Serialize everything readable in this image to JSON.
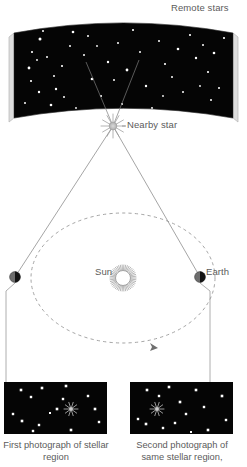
{
  "figure": {
    "topic": "stellar-parallax",
    "background_color": "#ffffff",
    "ink_color": "#5b5b5b",
    "sky_color": "#050505",
    "star_color": "#ffffff",
    "slab_edge_color": "#d8d8d8"
  },
  "labels": {
    "remote_stars": "Remote stars",
    "nearby_star": "Nearby star",
    "sun": "Sun",
    "earth": "Earth"
  },
  "captions": {
    "first_photo": "First photograph of stellar region",
    "second_photo": "Second photograph of same stellar region,"
  },
  "icons": {
    "nearby_star": "starburst-icon",
    "sun": "sun-rays-icon",
    "earth_left": "earth-half-lit-icon",
    "earth_right": "earth-half-lit-icon",
    "orbit_direction": "arrowhead-icon",
    "photo_star_left": "starburst-icon",
    "photo_star_right": "starburst-icon"
  },
  "sky_panel": {
    "left": 14,
    "top": 20,
    "right": 233,
    "bottom": 118,
    "curve_sag": 13,
    "stars": [
      {
        "x": 40,
        "y": 39,
        "r": 1.5
      },
      {
        "x": 32,
        "y": 52,
        "r": 1.1
      },
      {
        "x": 43,
        "y": 31,
        "r": 1.0
      },
      {
        "x": 29,
        "y": 68,
        "r": 1.4
      },
      {
        "x": 31,
        "y": 81,
        "r": 1.1
      },
      {
        "x": 39,
        "y": 92,
        "r": 1.2
      },
      {
        "x": 25,
        "y": 103,
        "r": 1.0
      },
      {
        "x": 51,
        "y": 105,
        "r": 1.3
      },
      {
        "x": 54,
        "y": 76,
        "r": 1.0
      },
      {
        "x": 62,
        "y": 66,
        "r": 1.1
      },
      {
        "x": 47,
        "y": 57,
        "r": 1.0
      },
      {
        "x": 37,
        "y": 60,
        "r": 0.9
      },
      {
        "x": 56,
        "y": 89,
        "r": 1.2
      },
      {
        "x": 70,
        "y": 46,
        "r": 1.0
      },
      {
        "x": 73,
        "y": 32,
        "r": 1.3
      },
      {
        "x": 84,
        "y": 55,
        "r": 1.0
      },
      {
        "x": 92,
        "y": 79,
        "r": 1.3
      },
      {
        "x": 88,
        "y": 36,
        "r": 1.0
      },
      {
        "x": 101,
        "y": 96,
        "r": 1.1
      },
      {
        "x": 108,
        "y": 62,
        "r": 1.2
      },
      {
        "x": 118,
        "y": 43,
        "r": 1.0
      },
      {
        "x": 114,
        "y": 80,
        "r": 1.0
      },
      {
        "x": 127,
        "y": 70,
        "r": 1.4
      },
      {
        "x": 133,
        "y": 30,
        "r": 1.1
      },
      {
        "x": 140,
        "y": 52,
        "r": 1.0
      },
      {
        "x": 146,
        "y": 86,
        "r": 1.2
      },
      {
        "x": 152,
        "y": 108,
        "r": 1.0
      },
      {
        "x": 159,
        "y": 41,
        "r": 1.0
      },
      {
        "x": 165,
        "y": 64,
        "r": 1.1
      },
      {
        "x": 172,
        "y": 77,
        "r": 1.0
      },
      {
        "x": 178,
        "y": 49,
        "r": 1.3
      },
      {
        "x": 183,
        "y": 92,
        "r": 1.0
      },
      {
        "x": 190,
        "y": 35,
        "r": 1.1
      },
      {
        "x": 196,
        "y": 58,
        "r": 1.2
      },
      {
        "x": 203,
        "y": 45,
        "r": 1.0
      },
      {
        "x": 208,
        "y": 72,
        "r": 1.1
      },
      {
        "x": 214,
        "y": 53,
        "r": 1.3
      },
      {
        "x": 219,
        "y": 88,
        "r": 1.0
      },
      {
        "x": 224,
        "y": 38,
        "r": 1.1
      },
      {
        "x": 211,
        "y": 100,
        "r": 1.0
      },
      {
        "x": 200,
        "y": 86,
        "r": 0.9
      },
      {
        "x": 163,
        "y": 96,
        "r": 0.9
      },
      {
        "x": 97,
        "y": 46,
        "r": 0.9
      },
      {
        "x": 64,
        "y": 97,
        "r": 1.0
      },
      {
        "x": 122,
        "y": 104,
        "r": 1.0
      },
      {
        "x": 76,
        "y": 108,
        "r": 0.9
      }
    ]
  },
  "geometry": {
    "nearby_star": {
      "x": 113,
      "y": 126
    },
    "sun": {
      "x": 123,
      "y": 278
    },
    "earth_left": {
      "x": 15,
      "y": 277
    },
    "earth_right": {
      "x": 200,
      "y": 277
    },
    "orbit": {
      "cx": 123,
      "cy": 278,
      "rx": 92,
      "ry": 65
    },
    "orbit_arrow": {
      "x": 154,
      "y": 347
    },
    "sight_line_left_end": {
      "x": 86,
      "y": 62
    },
    "sight_line_right_end": {
      "x": 139,
      "y": 60
    }
  },
  "photographs": [
    {
      "id": "first",
      "left": 4,
      "top": 382,
      "width": 103,
      "height": 52,
      "target_star": {
        "x": 71,
        "y": 409
      },
      "stars": [
        {
          "x": 21,
          "y": 390,
          "r": 1.3
        },
        {
          "x": 31,
          "y": 397,
          "r": 1.2
        },
        {
          "x": 42,
          "y": 388,
          "r": 1.3
        },
        {
          "x": 13,
          "y": 414,
          "r": 1.2
        },
        {
          "x": 22,
          "y": 421,
          "r": 1.3
        },
        {
          "x": 39,
          "y": 425,
          "r": 1.2
        },
        {
          "x": 33,
          "y": 431,
          "r": 1.2
        },
        {
          "x": 57,
          "y": 409,
          "r": 1.3
        },
        {
          "x": 63,
          "y": 399,
          "r": 1.2
        },
        {
          "x": 66,
          "y": 386,
          "r": 1.3
        },
        {
          "x": 88,
          "y": 396,
          "r": 1.2
        },
        {
          "x": 95,
          "y": 409,
          "r": 1.3
        },
        {
          "x": 99,
          "y": 422,
          "r": 1.2
        },
        {
          "x": 71,
          "y": 430,
          "r": 1.3
        },
        {
          "x": 50,
          "y": 413,
          "r": 1.0
        }
      ]
    },
    {
      "id": "second",
      "left": 130,
      "top": 382,
      "width": 103,
      "height": 52,
      "target_star": {
        "x": 157,
        "y": 409
      },
      "stars": [
        {
          "x": 147,
          "y": 390,
          "r": 1.3
        },
        {
          "x": 159,
          "y": 396,
          "r": 1.2
        },
        {
          "x": 169,
          "y": 387,
          "r": 1.3
        },
        {
          "x": 138,
          "y": 419,
          "r": 1.2
        },
        {
          "x": 146,
          "y": 424,
          "r": 1.3
        },
        {
          "x": 163,
          "y": 428,
          "r": 1.2
        },
        {
          "x": 180,
          "y": 402,
          "r": 1.3
        },
        {
          "x": 186,
          "y": 414,
          "r": 1.2
        },
        {
          "x": 175,
          "y": 423,
          "r": 1.2
        },
        {
          "x": 196,
          "y": 390,
          "r": 1.3
        },
        {
          "x": 204,
          "y": 407,
          "r": 1.2
        },
        {
          "x": 222,
          "y": 396,
          "r": 1.3
        },
        {
          "x": 226,
          "y": 420,
          "r": 1.2
        },
        {
          "x": 208,
          "y": 430,
          "r": 1.3
        },
        {
          "x": 191,
          "y": 432,
          "r": 1.0
        }
      ]
    }
  ]
}
